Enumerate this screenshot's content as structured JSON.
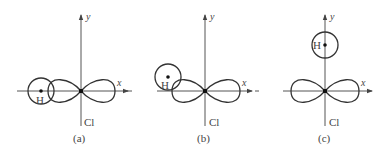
{
  "diagram": {
    "type": "orbital-overlap",
    "panels": [
      {
        "id": "a",
        "caption": "(a)",
        "x_axis_label": "x",
        "y_axis_label": "y",
        "atom_center_label": "Cl",
        "h_label": "H",
        "h_position": "on negative x-axis, overlapping p-orbital lobe head-on"
      },
      {
        "id": "b",
        "caption": "(b)",
        "x_axis_label": "x",
        "y_axis_label": "y",
        "atom_center_label": "Cl",
        "h_label": "H",
        "h_position": "above-left of negative x-axis, partial overlap with lobe"
      },
      {
        "id": "c",
        "caption": "(c)",
        "x_axis_label": "x",
        "y_axis_label": "y",
        "atom_center_label": "Cl",
        "h_label": "H",
        "h_position": "on positive y-axis, no overlap with p-orbital"
      }
    ]
  }
}
